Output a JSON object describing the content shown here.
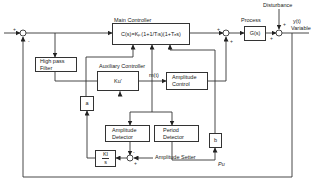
{
  "diagram": {
    "type": "control-system-block-diagram",
    "blocks": {
      "main_controller": {
        "title": "Main Controller",
        "formula": "C(s)=Kₚ(1+1/Tᵢs)(1+Tₑs)"
      },
      "process": {
        "title": "Process",
        "formula": "G(s)"
      },
      "high_pass_filter": {
        "line1": "High pass",
        "line2": "Filter"
      },
      "auxiliary_controller": {
        "title": "Auxiliary Controller",
        "formula": "Ku'"
      },
      "amplitude_control": {
        "line1": "Amplitude",
        "line2": "Control"
      },
      "alpha_block": {
        "symbol": "a"
      },
      "b_block": {
        "symbol": "b"
      },
      "amplitude_detector": {
        "line1": "Amplitude",
        "line2": "Detector"
      },
      "period_detector": {
        "line1": "Period",
        "line2": "Detector"
      },
      "integrator": {
        "numerator": "KI",
        "denominator": "s"
      }
    },
    "signals": {
      "disturbance": "Disturbance",
      "output": "y(t)",
      "output_label": "Variable",
      "aux_output": "m(t)",
      "period_signal": "Pu",
      "amplitude_setter": "Amplitude Setter"
    },
    "signs": {
      "sum1_in": "+",
      "sum1_fb": "-",
      "sum2_in": "+",
      "sum2_aux": "+",
      "sum3_in": "+",
      "sum3_dist": "+",
      "sum4_det": "-",
      "sum4_set": "+"
    }
  }
}
